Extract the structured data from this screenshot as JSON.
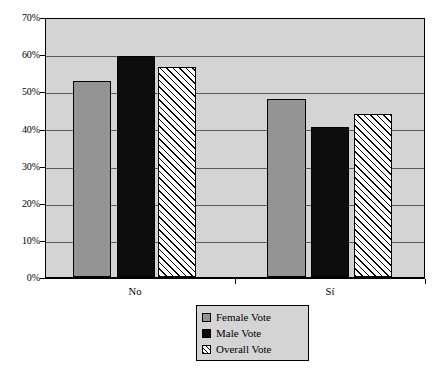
{
  "chart_data": {
    "type": "bar",
    "title": "",
    "xlabel": "",
    "ylabel": "",
    "categories": [
      "No",
      "Sí"
    ],
    "series": [
      {
        "name": "Female Vote",
        "values": [
          52.8,
          48.0
        ]
      },
      {
        "name": "Male Vote",
        "values": [
          59.6,
          40.4
        ]
      },
      {
        "name": "Overall Vote",
        "values": [
          56.6,
          44.0
        ]
      }
    ],
    "ylim": [
      0,
      70
    ],
    "ytick_values": [
      0,
      10,
      20,
      30,
      40,
      50,
      60,
      70
    ],
    "ytick_labels": [
      "0%",
      "10%",
      "20%",
      "30%",
      "40%",
      "50%",
      "60%",
      "70%"
    ],
    "grid": "horizontal",
    "legend_position": "bottom-center",
    "value_format": "percent",
    "colors": {
      "female": "#949494",
      "male": "#0d0d0d",
      "overall": "#ffffff",
      "plot_background": "#d4d4d4",
      "gridline": "#5a5a5a",
      "axis": "#000000",
      "legend_background": "#d4d4d4"
    }
  },
  "axis": {
    "y_labels": [
      "70%",
      "60%",
      "50%",
      "40%",
      "30%",
      "20%",
      "10%",
      "0%"
    ],
    "x_labels": [
      "No",
      "Sí"
    ]
  },
  "legend": {
    "items": [
      {
        "label": "Female Vote",
        "swatch": "female-swatch-icon"
      },
      {
        "label": "Male Vote",
        "swatch": "male-swatch-icon"
      },
      {
        "label": "Overall Vote",
        "swatch": "overall-swatch-icon"
      }
    ]
  }
}
